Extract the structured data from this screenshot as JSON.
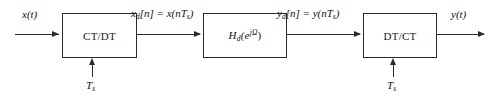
{
  "diagram": {
    "background_color": "#ffffff",
    "line_color": "#2b2b2b",
    "text_color": "#111111",
    "blocks": [
      {
        "id": "ct_dt",
        "label": "CT/DT"
      },
      {
        "id": "hd",
        "label": "H_d(e^{jOmega})",
        "label_main": "H",
        "label_sub": "d",
        "label_open": "(e",
        "label_exp": "jΩ",
        "label_close": ")"
      },
      {
        "id": "dt_ct",
        "label": "DT/CT"
      }
    ],
    "signals": {
      "input_ct": {
        "base": "x",
        "arg": "(t)",
        "full": "x(t)"
      },
      "output_ct": {
        "base": "y",
        "arg": "(t)",
        "full": "y(t)"
      },
      "input_dt": {
        "full": "x_d[n] = x(nT_s)",
        "base": "x",
        "sub": "d",
        "bracket": "[n] = x(n",
        "period": "T",
        "period_sub": "s",
        "close": ")"
      },
      "output_dt": {
        "full": "y_d[n] = y(nT_s)",
        "base": "y",
        "sub": "d",
        "bracket": "[n] = y(n",
        "period": "T",
        "period_sub": "s",
        "close": ")"
      }
    },
    "clocks": [
      {
        "id": "ts_left",
        "base": "T",
        "sub": "s",
        "full": "T_s"
      },
      {
        "id": "ts_right",
        "base": "T",
        "sub": "s",
        "full": "T_s"
      }
    ]
  }
}
